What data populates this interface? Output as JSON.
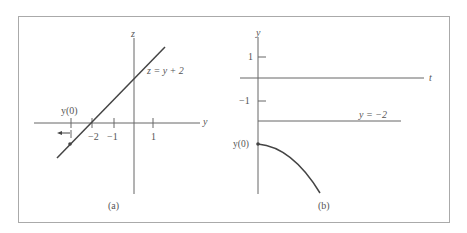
{
  "figure": {
    "panel_a": {
      "caption": "(a)",
      "horizontal_axis_label": "y",
      "vertical_axis_label": "z",
      "line_label": "z = y + 2",
      "point_label": "y(0)",
      "tick_labels": [
        "−2",
        "−1",
        "1"
      ]
    },
    "panel_b": {
      "caption": "(b)",
      "horizontal_axis_label": "t",
      "vertical_axis_label": "y",
      "tick_labels": [
        "1",
        "−1"
      ],
      "asymptote_label": "y = −2",
      "point_label": "y(0)"
    },
    "colors": {
      "line": "#555555",
      "frame": "#aaaaaa",
      "text": "#555555"
    }
  }
}
